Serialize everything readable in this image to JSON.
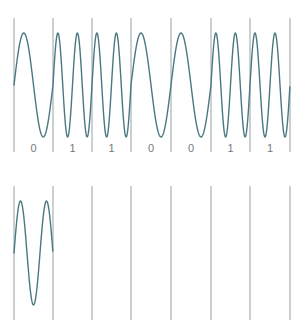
{
  "figure": {
    "background_color": "#ffffff",
    "wave_color": "#4a7880",
    "gridline_color": "#9aa0a3",
    "label_color": "#73797c",
    "bit_labels": [
      "0",
      "1",
      "1",
      "0",
      "0",
      "1",
      "1"
    ],
    "gridline_positions": [
      14,
      53,
      92,
      131,
      171,
      211,
      250,
      290
    ]
  },
  "chart_data": [
    {
      "type": "line",
      "name": "fsk-waveform",
      "title": "",
      "xlabel": "",
      "ylabel": "",
      "grid": true,
      "legend": "none",
      "bits": [
        "0",
        "1",
        "1",
        "0",
        "0",
        "1",
        "1"
      ],
      "modulation": "FSK",
      "description": "Frequency shift keying: bit 0 is one sine cycle per bit interval, bit 1 is two sine cycles per bit interval.",
      "cycles_per_bit": {
        "0": 1,
        "1": 2
      },
      "cycles_sequence": [
        1,
        2,
        2,
        1,
        1,
        2,
        2
      ],
      "amplitude": 1,
      "xlim": [
        0,
        7
      ],
      "ylim": [
        -1,
        1
      ],
      "bit_boundaries": [
        0,
        1,
        2,
        3,
        4,
        5,
        6,
        7
      ],
      "tick_labels": [
        "0",
        "1",
        "1",
        "0",
        "0",
        "1",
        "1"
      ]
    },
    {
      "type": "line",
      "name": "psk-waveform",
      "title": "",
      "xlabel": "",
      "ylabel": "",
      "grid": true,
      "legend": "none",
      "bits": [
        "0",
        "1",
        "1",
        "0",
        "0",
        "1",
        "1"
      ],
      "modulation": "PSK",
      "description": "Phase shift keying: constant carrier frequency of 1.5 cycles per bit interval; the carrier phase is inverted (180 degrees) whenever the bit value changes.",
      "cycles_per_bit": {
        "0": 1.5,
        "1": 1.5
      },
      "phase_sequence_deg": [
        0,
        180,
        180,
        0,
        0,
        180,
        180
      ],
      "amplitude": 1,
      "xlim": [
        0,
        7
      ],
      "ylim": [
        -1,
        1
      ],
      "bit_boundaries": [
        0,
        1,
        2,
        3,
        4,
        5,
        6,
        7
      ],
      "tick_labels": [
        "0",
        "1",
        "1",
        "0",
        "0",
        "1",
        "1"
      ]
    }
  ]
}
